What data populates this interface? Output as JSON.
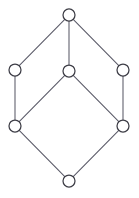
{
  "figure": {
    "kind": "hasse-diagram",
    "title": "",
    "width": 139,
    "height": 198,
    "background_color": "#ffffff",
    "edge_color": "#5a5a68",
    "node_stroke_color": "#3d3d46",
    "node_fill_color": "#ffffff",
    "node_radius": 6,
    "edge_width": 1.05,
    "node_stroke_width": 1.25
  },
  "graph": {
    "node_count": 7,
    "edge_count": 9,
    "nodes": [
      {
        "id": "top",
        "label": "",
        "x": 69,
        "y": 15,
        "rank": 0
      },
      {
        "id": "upper-left",
        "label": "",
        "x": 15,
        "y": 70,
        "rank": 1
      },
      {
        "id": "middle",
        "label": "",
        "x": 69,
        "y": 71,
        "rank": 1
      },
      {
        "id": "upper-right",
        "label": "",
        "x": 123,
        "y": 70,
        "rank": 1
      },
      {
        "id": "lower-left",
        "label": "",
        "x": 15,
        "y": 126,
        "rank": 2
      },
      {
        "id": "lower-right",
        "label": "",
        "x": 123,
        "y": 126,
        "rank": 2
      },
      {
        "id": "bottom",
        "label": "",
        "x": 69,
        "y": 181,
        "rank": 3
      }
    ],
    "edges": [
      {
        "id": "e1",
        "from": "top",
        "to": "upper-left"
      },
      {
        "id": "e2",
        "from": "top",
        "to": "middle"
      },
      {
        "id": "e3",
        "from": "top",
        "to": "upper-right"
      },
      {
        "id": "e4",
        "from": "upper-left",
        "to": "lower-left"
      },
      {
        "id": "e5",
        "from": "middle",
        "to": "lower-left"
      },
      {
        "id": "e6",
        "from": "middle",
        "to": "lower-right"
      },
      {
        "id": "e7",
        "from": "upper-right",
        "to": "lower-right"
      },
      {
        "id": "e8",
        "from": "lower-left",
        "to": "bottom"
      },
      {
        "id": "e9",
        "from": "lower-right",
        "to": "bottom"
      }
    ]
  }
}
